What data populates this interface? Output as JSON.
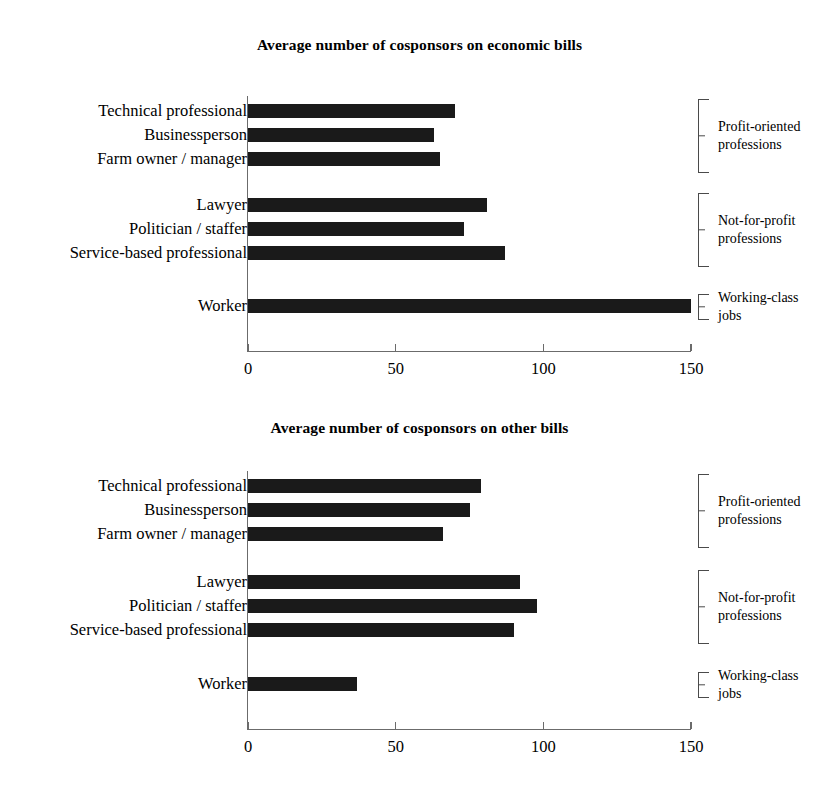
{
  "chart_data": [
    {
      "type": "bar",
      "orientation": "horizontal",
      "title": "Average number of cosponsors on economic bills",
      "xlabel": "",
      "ylabel": "",
      "xlim": [
        0,
        150
      ],
      "xticks": [
        0,
        50,
        100,
        150
      ],
      "xtick_labels": [
        "0",
        "50",
        "100",
        "150"
      ],
      "grid": false,
      "legend": false,
      "bar_color": "#1a1a1a",
      "categories": [
        "Technical professional",
        "Businessperson",
        "Farm owner / manager",
        "Lawyer",
        "Politician / staffer",
        "Service-based professional",
        "Worker"
      ],
      "values": [
        70,
        63,
        65,
        81,
        73,
        87,
        150
      ],
      "groups": [
        {
          "label": "Profit-oriented professions",
          "members": [
            "Technical professional",
            "Businessperson",
            "Farm owner / manager"
          ]
        },
        {
          "label": "Not-for-profit professions",
          "members": [
            "Lawyer",
            "Politician / staffer",
            "Service-based professional"
          ]
        },
        {
          "label": "Working-class jobs",
          "members": [
            "Worker"
          ]
        }
      ]
    },
    {
      "type": "bar",
      "orientation": "horizontal",
      "title": "Average number of cosponsors on other bills",
      "xlabel": "",
      "ylabel": "",
      "xlim": [
        0,
        150
      ],
      "xticks": [
        0,
        50,
        100,
        150
      ],
      "xtick_labels": [
        "0",
        "50",
        "100",
        "150"
      ],
      "grid": false,
      "legend": false,
      "bar_color": "#1a1a1a",
      "categories": [
        "Technical professional",
        "Businessperson",
        "Farm owner / manager",
        "Lawyer",
        "Politician / staffer",
        "Service-based professional",
        "Worker"
      ],
      "values": [
        79,
        75,
        66,
        92,
        98,
        90,
        37
      ],
      "groups": [
        {
          "label": "Profit-oriented professions",
          "members": [
            "Technical professional",
            "Businessperson",
            "Farm owner / manager"
          ]
        },
        {
          "label": "Not-for-profit professions",
          "members": [
            "Lawyer",
            "Politician / staffer",
            "Service-based professional"
          ]
        },
        {
          "label": "Working-class jobs",
          "members": [
            "Worker"
          ]
        }
      ]
    }
  ],
  "charts": [
    {
      "title": "Average number of cosponsors on economic bills",
      "axis": {
        "ticks": [
          {
            "label": "0",
            "value": 0
          },
          {
            "label": "50",
            "value": 50
          },
          {
            "label": "100",
            "value": 100
          },
          {
            "label": "150",
            "value": 150
          }
        ]
      },
      "rows": [
        {
          "label": "Technical professional",
          "value": 70
        },
        {
          "label": "Businessperson",
          "value": 63
        },
        {
          "label": "Farm owner / manager",
          "value": 65
        },
        {
          "label": "Lawyer",
          "value": 81
        },
        {
          "label": "Politician / staffer",
          "value": 73
        },
        {
          "label": "Service-based professional",
          "value": 87
        },
        {
          "label": "Worker",
          "value": 150
        }
      ],
      "brackets": [
        {
          "label_line1": "Profit-oriented",
          "label_line2": "professions"
        },
        {
          "label_line1": "Not-for-profit",
          "label_line2": "professions"
        },
        {
          "label_line1": "Working-class",
          "label_line2": "jobs"
        }
      ]
    },
    {
      "title": "Average number of cosponsors on other bills",
      "axis": {
        "ticks": [
          {
            "label": "0",
            "value": 0
          },
          {
            "label": "50",
            "value": 50
          },
          {
            "label": "100",
            "value": 100
          },
          {
            "label": "150",
            "value": 150
          }
        ]
      },
      "rows": [
        {
          "label": "Technical professional",
          "value": 79
        },
        {
          "label": "Businessperson",
          "value": 75
        },
        {
          "label": "Farm owner / manager",
          "value": 66
        },
        {
          "label": "Lawyer",
          "value": 92
        },
        {
          "label": "Politician / staffer",
          "value": 98
        },
        {
          "label": "Service-based professional",
          "value": 90
        },
        {
          "label": "Worker",
          "value": 37
        }
      ],
      "brackets": [
        {
          "label_line1": "Profit-oriented",
          "label_line2": "professions"
        },
        {
          "label_line1": "Not-for-profit",
          "label_line2": "professions"
        },
        {
          "label_line1": "Working-class",
          "label_line2": "jobs"
        }
      ]
    }
  ]
}
